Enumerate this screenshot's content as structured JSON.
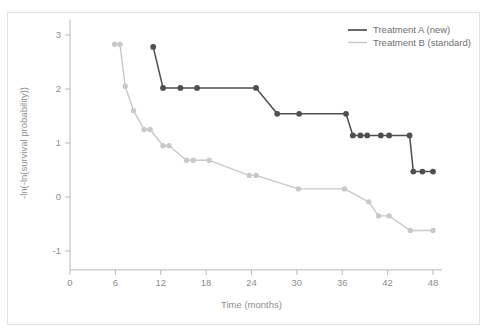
{
  "chart_data": {
    "type": "line",
    "title": "",
    "subtitle": "",
    "xlabel": "Time (months)",
    "ylabel": "-ln(-ln(survival probability))",
    "xlim": [
      -2,
      50
    ],
    "ylim": [
      -1.35,
      3.25
    ],
    "xticks": [
      0,
      6,
      12,
      18,
      24,
      30,
      36,
      42,
      48
    ],
    "xtick_labels": [
      "0",
      "6",
      "12",
      "18",
      "24",
      "30",
      "36",
      "42",
      "48"
    ],
    "yticks": [
      -1,
      0,
      1,
      2,
      3
    ],
    "ytick_labels": [
      "-1",
      "0",
      "1",
      "2",
      "3"
    ],
    "grid": false,
    "legend_position": "top-right",
    "markers": "circle",
    "series": [
      {
        "name": "Treatment A (new)",
        "color": "#4f4f4f",
        "points": [
          [
            11.0,
            2.78
          ],
          [
            12.3,
            2.02
          ],
          [
            14.6,
            2.02
          ],
          [
            16.8,
            2.02
          ],
          [
            24.6,
            2.02
          ],
          [
            27.4,
            1.54
          ],
          [
            30.3,
            1.54
          ],
          [
            36.5,
            1.54
          ],
          [
            37.4,
            1.14
          ],
          [
            38.4,
            1.14
          ],
          [
            39.3,
            1.14
          ],
          [
            41.1,
            1.14
          ],
          [
            42.2,
            1.14
          ],
          [
            44.9,
            1.14
          ],
          [
            45.4,
            0.47
          ],
          [
            46.6,
            0.47
          ],
          [
            48.0,
            0.47
          ]
        ]
      },
      {
        "name": "Treatment B (standard)",
        "color": "#c9c9c9",
        "points": [
          [
            5.9,
            2.83
          ],
          [
            6.6,
            2.83
          ],
          [
            7.3,
            2.05
          ],
          [
            8.4,
            1.6
          ],
          [
            9.8,
            1.25
          ],
          [
            10.6,
            1.25
          ],
          [
            12.3,
            0.95
          ],
          [
            13.1,
            0.95
          ],
          [
            15.4,
            0.68
          ],
          [
            16.3,
            0.68
          ],
          [
            18.4,
            0.68
          ],
          [
            23.7,
            0.4
          ],
          [
            24.6,
            0.4
          ],
          [
            30.2,
            0.15
          ],
          [
            36.3,
            0.15
          ],
          [
            39.5,
            -0.09
          ],
          [
            40.8,
            -0.35
          ],
          [
            42.2,
            -0.35
          ],
          [
            45.0,
            -0.62
          ],
          [
            48.0,
            -0.62
          ]
        ]
      }
    ]
  },
  "legend": {
    "entries": [
      {
        "label": "Treatment A (new)",
        "color": "#4f4f4f"
      },
      {
        "label": "Treatment B (standard)",
        "color": "#c9c9c9"
      }
    ]
  },
  "axes": {
    "x_title": "Time (months)",
    "y_title": "-ln(-ln(survival probability))"
  }
}
